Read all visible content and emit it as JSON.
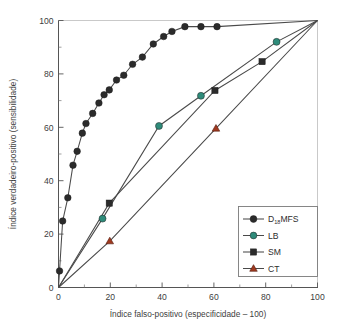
{
  "chart_data": {
    "type": "line",
    "title": "",
    "subtitle": "",
    "xlabel": "Índice falso-positivo (especificidade – 100)",
    "ylabel": "Índice verdadeiro-positivo (sensibilidade)",
    "xlim": [
      0,
      100
    ],
    "ylim": [
      0,
      100
    ],
    "xticks": [
      0,
      20,
      40,
      60,
      80,
      100
    ],
    "yticks": [
      0,
      20,
      40,
      60,
      80,
      100
    ],
    "xtick_labels": [
      "0",
      "20",
      "40",
      "60",
      "80",
      "100"
    ],
    "ytick_labels": [
      "0",
      "20",
      "40",
      "60",
      "80",
      "100"
    ],
    "minor_ticks": true,
    "grid": false,
    "legend_position": "lower-right",
    "series": [
      {
        "name": "D18MFS",
        "label_main": "D",
        "label_sub": "18",
        "label_tail": "MFS",
        "marker": "circle",
        "color": "#2b2b2b",
        "line_color": "#4a4a4a",
        "points": [
          [
            0.0,
            0.0
          ],
          [
            0.4,
            6.2
          ],
          [
            1.6,
            24.9
          ],
          [
            3.6,
            33.6
          ],
          [
            5.6,
            45.8
          ],
          [
            7.2,
            51.0
          ],
          [
            9.2,
            57.8
          ],
          [
            10.6,
            61.4
          ],
          [
            13.2,
            65.2
          ],
          [
            15.6,
            69.1
          ],
          [
            17.6,
            72.2
          ],
          [
            19.6,
            74.0
          ],
          [
            22.4,
            77.7
          ],
          [
            25.2,
            79.5
          ],
          [
            28.6,
            83.6
          ],
          [
            32.4,
            86.3
          ],
          [
            36.6,
            91.2
          ],
          [
            40.6,
            94.0
          ],
          [
            43.8,
            95.9
          ],
          [
            48.8,
            97.7
          ],
          [
            55.0,
            97.7
          ],
          [
            61.2,
            97.7
          ],
          [
            100.0,
            100.0
          ]
        ]
      },
      {
        "name": "LB",
        "label_main": "LB",
        "marker": "circle",
        "color": "#2e8b7a",
        "line_color": "#4a4a4a",
        "points": [
          [
            0.0,
            0.0
          ],
          [
            17.0,
            25.8
          ],
          [
            38.8,
            60.5
          ],
          [
            55.0,
            71.8
          ],
          [
            84.2,
            92.0
          ],
          [
            100.0,
            100.0
          ]
        ]
      },
      {
        "name": "SM",
        "label_main": "SM",
        "marker": "square",
        "color": "#2b2b2b",
        "line_color": "#4a4a4a",
        "points": [
          [
            0.0,
            0.0
          ],
          [
            19.6,
            31.6
          ],
          [
            60.4,
            73.8
          ],
          [
            78.6,
            84.6
          ],
          [
            100.0,
            100.0
          ]
        ]
      },
      {
        "name": "CT",
        "label_main": "CT",
        "marker": "triangle",
        "color": "#a03a20",
        "line_color": "#4a4a4a",
        "points": [
          [
            0.0,
            0.0
          ],
          [
            19.8,
            17.4
          ],
          [
            60.8,
            59.6
          ],
          [
            100.0,
            100.0
          ]
        ]
      }
    ]
  },
  "legend": {
    "entries": [
      {
        "label": "D18MFS",
        "main": "D",
        "sub": "18",
        "tail": "MFS",
        "marker": "circle",
        "color": "#2b2b2b"
      },
      {
        "label": "LB",
        "main": "LB",
        "sub": "",
        "tail": "",
        "marker": "circle",
        "color": "#2e8b7a"
      },
      {
        "label": "SM",
        "main": "SM",
        "sub": "",
        "tail": "",
        "marker": "square",
        "color": "#2b2b2b"
      },
      {
        "label": "CT",
        "main": "CT",
        "sub": "",
        "tail": "",
        "marker": "triangle",
        "color": "#a03a20"
      }
    ]
  },
  "colors": {
    "axis": "#555555",
    "line": "#4a4a4a",
    "marker_dark": "#2b2b2b",
    "marker_teal": "#2e8b7a",
    "marker_red": "#a03a20",
    "background": "#ffffff"
  }
}
